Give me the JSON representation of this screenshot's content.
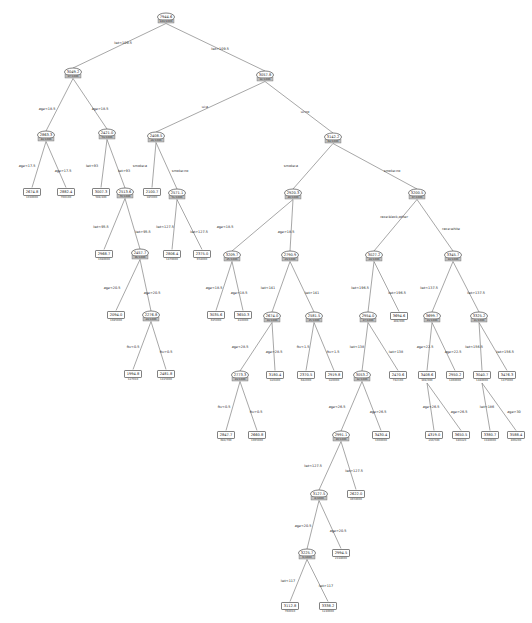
{
  "figure": {
    "title": "",
    "type": "decision-tree",
    "background": "#ffffff",
    "line_color": "#6b6b6b",
    "node_stroke": "#4a4a4a",
    "band_color": "#bdbdbd"
  },
  "nodes": [
    {
      "id": "n0",
      "shape": "ellipse",
      "x": 166,
      "y": 17,
      "value": "7944.6",
      "sub": "189/1000"
    },
    {
      "id": "n1",
      "shape": "ellipse",
      "x": 73,
      "y": 72,
      "value": "3049.2",
      "sub": "97/1000"
    },
    {
      "id": "n2",
      "shape": "ellipse",
      "x": 265,
      "y": 75,
      "value": "3057.8",
      "sub": "92/1000"
    },
    {
      "id": "n3",
      "shape": "ellipse",
      "x": 46,
      "y": 135,
      "value": "2863.3",
      "sub": "44/1000"
    },
    {
      "id": "n4",
      "shape": "ellipse",
      "x": 107,
      "y": 133,
      "value": "2421.0",
      "sub": "53/1000"
    },
    {
      "id": "n5",
      "shape": "ellipse",
      "x": 156,
      "y": 136,
      "value": "2408.5",
      "sub": "28/1000"
    },
    {
      "id": "n6",
      "shape": "ellipse",
      "x": 333,
      "y": 137,
      "value": "3142.2",
      "sub": "64/1000"
    },
    {
      "id": "n7",
      "shape": "rect",
      "x": 32,
      "y": 192,
      "value": "2674.8",
      "sub": "1030000"
    },
    {
      "id": "n8",
      "shape": "rect",
      "x": 66,
      "y": 192,
      "value": "2882.4",
      "sub": "700100"
    },
    {
      "id": "n9",
      "shape": "rect",
      "x": 101,
      "y": 192,
      "value": "3007.3",
      "sub": "508/400"
    },
    {
      "id": "n10",
      "shape": "ellipse",
      "x": 125,
      "y": 192,
      "value": "2513.6",
      "sub": "70/1000"
    },
    {
      "id": "n11",
      "shape": "rect",
      "x": 152,
      "y": 192,
      "value": "2100.7",
      "sub": "985000"
    },
    {
      "id": "n12",
      "shape": "ellipse",
      "x": 177,
      "y": 193,
      "value": "2571.1",
      "sub": "51/1000"
    },
    {
      "id": "n13",
      "shape": "ellipse",
      "x": 293,
      "y": 193,
      "value": "2920.3",
      "sub": "40/1000"
    },
    {
      "id": "n14",
      "shape": "ellipse",
      "x": 417,
      "y": 193,
      "value": "3200.5",
      "sub": "37/1000"
    },
    {
      "id": "n15",
      "shape": "rect",
      "x": 104,
      "y": 254,
      "value": "2968.7",
      "sub": "1080000"
    },
    {
      "id": "n16",
      "shape": "ellipse",
      "x": 140,
      "y": 253,
      "value": "2457.7",
      "sub": "36/1000"
    },
    {
      "id": "n17",
      "shape": "rect",
      "x": 172,
      "y": 254,
      "value": "2806.4",
      "sub": "1470000"
    },
    {
      "id": "n18",
      "shape": "rect",
      "x": 202,
      "y": 254,
      "value": "2375.0",
      "sub": "658000"
    },
    {
      "id": "n19",
      "shape": "ellipse",
      "x": 232,
      "y": 255,
      "value": "3209.7",
      "sub": "25/1000"
    },
    {
      "id": "n20",
      "shape": "ellipse",
      "x": 290,
      "y": 255,
      "value": "2790.9",
      "sub": "23/1000"
    },
    {
      "id": "n21",
      "shape": "ellipse",
      "x": 374,
      "y": 255,
      "value": "3027.2",
      "sub": "24/1000"
    },
    {
      "id": "n22",
      "shape": "ellipse",
      "x": 453,
      "y": 255,
      "value": "3345.7",
      "sub": "19/1000"
    },
    {
      "id": "n23",
      "shape": "rect",
      "x": 116,
      "y": 315,
      "value": "2094.0",
      "sub": "1085000"
    },
    {
      "id": "n24",
      "shape": "ellipse",
      "x": 151,
      "y": 315,
      "value": "2276.8",
      "sub": "24/1000"
    },
    {
      "id": "n25",
      "shape": "rect",
      "x": 216,
      "y": 315,
      "value": "3035.6",
      "sub": "695000"
    },
    {
      "id": "n26",
      "shape": "rect",
      "x": 243,
      "y": 315,
      "value": "3650.3",
      "sub": "810000"
    },
    {
      "id": "n27",
      "shape": "ellipse",
      "x": 272,
      "y": 316,
      "value": "2674.0",
      "sub": "19/1000"
    },
    {
      "id": "n28",
      "shape": "ellipse",
      "x": 314,
      "y": 316,
      "value": "2581.5",
      "sub": "15/1000"
    },
    {
      "id": "n29",
      "shape": "ellipse",
      "x": 368,
      "y": 316,
      "value": "2954.0",
      "sub": "17/1000"
    },
    {
      "id": "n30",
      "shape": "rect",
      "x": 399,
      "y": 316,
      "value": "3694.6",
      "sub": "408/000"
    },
    {
      "id": "n31",
      "shape": "ellipse",
      "x": 432,
      "y": 316,
      "value": "3699.7",
      "sub": "13/1000"
    },
    {
      "id": "n32",
      "shape": "ellipse",
      "x": 479,
      "y": 316,
      "value": "3325.2",
      "sub": "11/1000"
    },
    {
      "id": "n33",
      "shape": "rect",
      "x": 133,
      "y": 374,
      "value": "1994.8",
      "sub": "127010"
    },
    {
      "id": "n34",
      "shape": "rect",
      "x": 166,
      "y": 374,
      "value": "2481.8",
      "sub": "1415000"
    },
    {
      "id": "n35",
      "shape": "ellipse",
      "x": 240,
      "y": 375,
      "value": "2773.3",
      "sub": "13/1000"
    },
    {
      "id": "n36",
      "shape": "rect",
      "x": 275,
      "y": 375,
      "value": "3180.4",
      "sub": "920400"
    },
    {
      "id": "n37",
      "shape": "rect",
      "x": 306,
      "y": 375,
      "value": "2370.5",
      "sub": "682000"
    },
    {
      "id": "n38",
      "shape": "rect",
      "x": 334,
      "y": 375,
      "value": "2919.8",
      "sub": "920000"
    },
    {
      "id": "n39",
      "shape": "ellipse",
      "x": 362,
      "y": 375,
      "value": "3053.2",
      "sub": "12/1000"
    },
    {
      "id": "n40",
      "shape": "rect",
      "x": 398,
      "y": 375,
      "value": "2470.6",
      "sub": "742100"
    },
    {
      "id": "n41",
      "shape": "rect",
      "x": 427,
      "y": 375,
      "value": "3408.6",
      "sub": "908/000"
    },
    {
      "id": "n42",
      "shape": "rect",
      "x": 455,
      "y": 375,
      "value": "2950.2",
      "sub": "1460000"
    },
    {
      "id": "n43",
      "shape": "rect",
      "x": 482,
      "y": 375,
      "value": "3040.7",
      "sub": "1480000"
    },
    {
      "id": "n44",
      "shape": "rect",
      "x": 507,
      "y": 375,
      "value": "3476.3",
      "sub": "1475000"
    },
    {
      "id": "n45",
      "shape": "rect",
      "x": 226,
      "y": 435,
      "value": "2847.7",
      "sub": "684/700"
    },
    {
      "id": "n46",
      "shape": "rect",
      "x": 257,
      "y": 435,
      "value": "2660.8",
      "sub": "1065000"
    },
    {
      "id": "n47",
      "shape": "ellipse",
      "x": 341,
      "y": 435,
      "value": "2991.1",
      "sub": "10/1000"
    },
    {
      "id": "n48",
      "shape": "rect",
      "x": 381,
      "y": 435,
      "value": "3430.4",
      "sub": "1000000"
    },
    {
      "id": "n49",
      "shape": "rect",
      "x": 434,
      "y": 435,
      "value": "4319.0",
      "sub": "230/500"
    },
    {
      "id": "n50",
      "shape": "rect",
      "x": 461,
      "y": 435,
      "value": "3650.5",
      "sub": "180420"
    },
    {
      "id": "n51",
      "shape": "rect",
      "x": 490,
      "y": 435,
      "value": "3380.7",
      "sub": "1940000"
    },
    {
      "id": "n52",
      "shape": "rect",
      "x": 516,
      "y": 435,
      "value": "3588.4",
      "sub": "806200"
    },
    {
      "id": "n53",
      "shape": "ellipse",
      "x": 319,
      "y": 494,
      "value": "3127.5",
      "sub": "8/1000"
    },
    {
      "id": "n54",
      "shape": "rect",
      "x": 356,
      "y": 494,
      "value": "2622.0",
      "sub": "9650000"
    },
    {
      "id": "n55",
      "shape": "ellipse",
      "x": 307,
      "y": 553,
      "value": "3225.7",
      "sub": "6/1000"
    },
    {
      "id": "n56",
      "shape": "rect",
      "x": 341,
      "y": 553,
      "value": "2994.5",
      "sub": "2198000"
    },
    {
      "id": "n57",
      "shape": "rect",
      "x": 290,
      "y": 606,
      "value": "3112.8",
      "sub": "760010"
    },
    {
      "id": "n58",
      "shape": "rect",
      "x": 328,
      "y": 606,
      "value": "3338.2",
      "sub": "1240000"
    }
  ],
  "edges": [
    {
      "from": "n0",
      "to": "n1",
      "label": "lwt<109.5",
      "lx": 123,
      "ly": 44
    },
    {
      "from": "n0",
      "to": "n2",
      "label": "lwt>109.5",
      "lx": 220,
      "ly": 50
    },
    {
      "from": "n1",
      "to": "n3",
      "label": "age<18.5",
      "lx": 47,
      "ly": 110
    },
    {
      "from": "n1",
      "to": "n4",
      "label": "age>18.5",
      "lx": 100,
      "ly": 110
    },
    {
      "from": "n2",
      "to": "n5",
      "label": "ui:a",
      "lx": 205,
      "ly": 108
    },
    {
      "from": "n2",
      "to": "n6",
      "label": "ui:no",
      "lx": 305,
      "ly": 113
    },
    {
      "from": "n3",
      "to": "n7",
      "label": "age<17.5",
      "lx": 27,
      "ly": 167
    },
    {
      "from": "n3",
      "to": "n8",
      "label": "age>17.5",
      "lx": 63,
      "ly": 172
    },
    {
      "from": "n4",
      "to": "n9",
      "label": "lwt<93",
      "lx": 92,
      "ly": 167
    },
    {
      "from": "n4",
      "to": "n10",
      "label": "lwt>93",
      "lx": 124,
      "ly": 172
    },
    {
      "from": "n5",
      "to": "n11",
      "label": "smoke:a",
      "lx": 140,
      "ly": 167
    },
    {
      "from": "n5",
      "to": "n12",
      "label": "smoke:no",
      "lx": 180,
      "ly": 172
    },
    {
      "from": "n6",
      "to": "n13",
      "label": "smoke:a",
      "lx": 291,
      "ly": 167
    },
    {
      "from": "n6",
      "to": "n14",
      "label": "smoke:no",
      "lx": 392,
      "ly": 172
    },
    {
      "from": "n10",
      "to": "n15",
      "label": "lwt<95.5",
      "lx": 101,
      "ly": 228
    },
    {
      "from": "n10",
      "to": "n16",
      "label": "lwt>95.5",
      "lx": 143,
      "ly": 233
    },
    {
      "from": "n12",
      "to": "n17",
      "label": "lwt<127.5",
      "lx": 165,
      "ly": 228
    },
    {
      "from": "n12",
      "to": "n18",
      "label": "lwt>127.5",
      "lx": 199,
      "ly": 233
    },
    {
      "from": "n13",
      "to": "n19",
      "label": "age<18.5",
      "lx": 225,
      "ly": 228
    },
    {
      "from": "n13",
      "to": "n20",
      "label": "age>18.5",
      "lx": 286,
      "ly": 233
    },
    {
      "from": "n14",
      "to": "n21",
      "label": "race:black,other",
      "lx": 394,
      "ly": 218
    },
    {
      "from": "n14",
      "to": "n22",
      "label": "race:white",
      "lx": 451,
      "ly": 230
    },
    {
      "from": "n16",
      "to": "n23",
      "label": "age<20.5",
      "lx": 112,
      "ly": 289
    },
    {
      "from": "n16",
      "to": "n24",
      "label": "age>20.5",
      "lx": 152,
      "ly": 294
    },
    {
      "from": "n19",
      "to": "n25",
      "label": "age<18.5",
      "lx": 214,
      "ly": 289
    },
    {
      "from": "n19",
      "to": "n26",
      "label": "age>18.5",
      "lx": 239,
      "ly": 294
    },
    {
      "from": "n20",
      "to": "n27",
      "label": "lwt<141",
      "lx": 268,
      "ly": 289
    },
    {
      "from": "n20",
      "to": "n28",
      "label": "lwt>141",
      "lx": 312,
      "ly": 294
    },
    {
      "from": "n21",
      "to": "n29",
      "label": "lwt<196.5",
      "lx": 360,
      "ly": 289
    },
    {
      "from": "n21",
      "to": "n30",
      "label": "lwt>196.5",
      "lx": 397,
      "ly": 294
    },
    {
      "from": "n22",
      "to": "n31",
      "label": "lwt<137.5",
      "lx": 429,
      "ly": 289
    },
    {
      "from": "n22",
      "to": "n32",
      "label": "lwt>137.5",
      "lx": 476,
      "ly": 294
    },
    {
      "from": "n24",
      "to": "n33",
      "label": "ftv<0.5",
      "lx": 133,
      "ly": 348
    },
    {
      "from": "n24",
      "to": "n34",
      "label": "ftv>0.5",
      "lx": 166,
      "ly": 353
    },
    {
      "from": "n27",
      "to": "n35",
      "label": "age<28.5",
      "lx": 240,
      "ly": 348
    },
    {
      "from": "n27",
      "to": "n36",
      "label": "age>28.5",
      "lx": 274,
      "ly": 353
    },
    {
      "from": "n28",
      "to": "n37",
      "label": "ftv<1.5",
      "lx": 303,
      "ly": 348
    },
    {
      "from": "n28",
      "to": "n38",
      "label": "ftv>1.5",
      "lx": 333,
      "ly": 353
    },
    {
      "from": "n29",
      "to": "n39",
      "label": "lwt<138",
      "lx": 357,
      "ly": 348
    },
    {
      "from": "n29",
      "to": "n40",
      "label": "lwt>138",
      "lx": 396,
      "ly": 353
    },
    {
      "from": "n31",
      "to": "n41",
      "label": "age<22.5",
      "lx": 425,
      "ly": 348
    },
    {
      "from": "n31",
      "to": "n42",
      "label": "age>22.5",
      "lx": 453,
      "ly": 353
    },
    {
      "from": "n32",
      "to": "n43",
      "label": "lwt<156.5",
      "lx": 474,
      "ly": 348
    },
    {
      "from": "n32",
      "to": "n44",
      "label": "lwt>156.5",
      "lx": 505,
      "ly": 353
    },
    {
      "from": "n35",
      "to": "n45",
      "label": "ftv<0.5",
      "lx": 224,
      "ly": 408
    },
    {
      "from": "n35",
      "to": "n46",
      "label": "ftv>0.5",
      "lx": 256,
      "ly": 413
    },
    {
      "from": "n39",
      "to": "n47",
      "label": "age<26.5",
      "lx": 337,
      "ly": 408
    },
    {
      "from": "n39",
      "to": "n48",
      "label": "age>26.5",
      "lx": 378,
      "ly": 413
    },
    {
      "from": "n41",
      "to": "n49",
      "label": "age<26.5",
      "lx": 431,
      "ly": 408
    },
    {
      "from": "n41",
      "to": "n50",
      "label": "age>26.5",
      "lx": 459,
      "ly": 413
    },
    {
      "from": "n43",
      "to": "n51",
      "label": "lwt<186",
      "lx": 487,
      "ly": 408
    },
    {
      "from": "n43",
      "to": "n52",
      "label": "age>30",
      "lx": 514,
      "ly": 413
    },
    {
      "from": "n47",
      "to": "n53",
      "label": "lwt<127.5",
      "lx": 313,
      "ly": 467
    },
    {
      "from": "n47",
      "to": "n54",
      "label": "lwt>127.5",
      "lx": 354,
      "ly": 472
    },
    {
      "from": "n53",
      "to": "n55",
      "label": "age<20.5",
      "lx": 303,
      "ly": 527
    },
    {
      "from": "n53",
      "to": "n56",
      "label": "age>20.5",
      "lx": 338,
      "ly": 532
    },
    {
      "from": "n55",
      "to": "n57",
      "label": "lwt<117",
      "lx": 288,
      "ly": 582
    },
    {
      "from": "n55",
      "to": "n58",
      "label": "lwt>117",
      "lx": 326,
      "ly": 587
    }
  ]
}
